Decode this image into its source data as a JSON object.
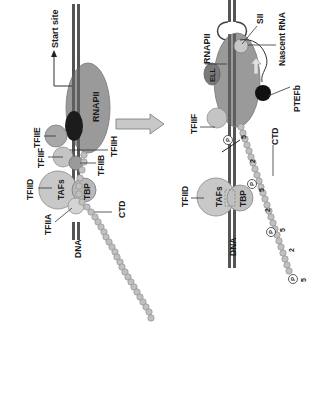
{
  "colors": {
    "dna": "#555555",
    "dna_light": "#bbbbbb",
    "rnapii": "#9a9a9a",
    "tfiih": "#1c1c1c",
    "factor_light": "#c8c8c8",
    "factor_mid": "#a8a8a8",
    "ctd_bead": "#c0c0c0",
    "arrow": "#c8c8c8",
    "ell": "#7a7a7a",
    "ptefb": "#111111",
    "text": "#1a1a1a"
  },
  "left_panel": {
    "labels": {
      "start_site": "Start site",
      "rnapii": "RNAPII",
      "tfiie": "TFIIE",
      "tfiif": "TFIIF",
      "tfiid": "TFIID",
      "tafs": "TAFs",
      "tbp": "TBP",
      "tfiib": "TFIIB",
      "tfiih": "TFIIH",
      "tfiia": "TFIIA",
      "ctd": "CTD",
      "dna": "DNA"
    }
  },
  "transition_arrow": {
    "label": ""
  },
  "right_panel": {
    "labels": {
      "sii": "SII",
      "nascent_rna": "Nascent RNA",
      "ell": "ELL",
      "rnapii": "RNAPII",
      "ptefb": "PTEFb",
      "tfiif": "TFIIF",
      "ctd": "CTD",
      "tfiid": "TFIID",
      "tafs": "TAFs",
      "tbp": "TBP",
      "dna": "DNA"
    },
    "ctd_marks": [
      "5",
      "2",
      "5",
      "2",
      "5",
      "2",
      "5"
    ],
    "phospho": [
      "P",
      "P",
      "P",
      "P"
    ]
  }
}
